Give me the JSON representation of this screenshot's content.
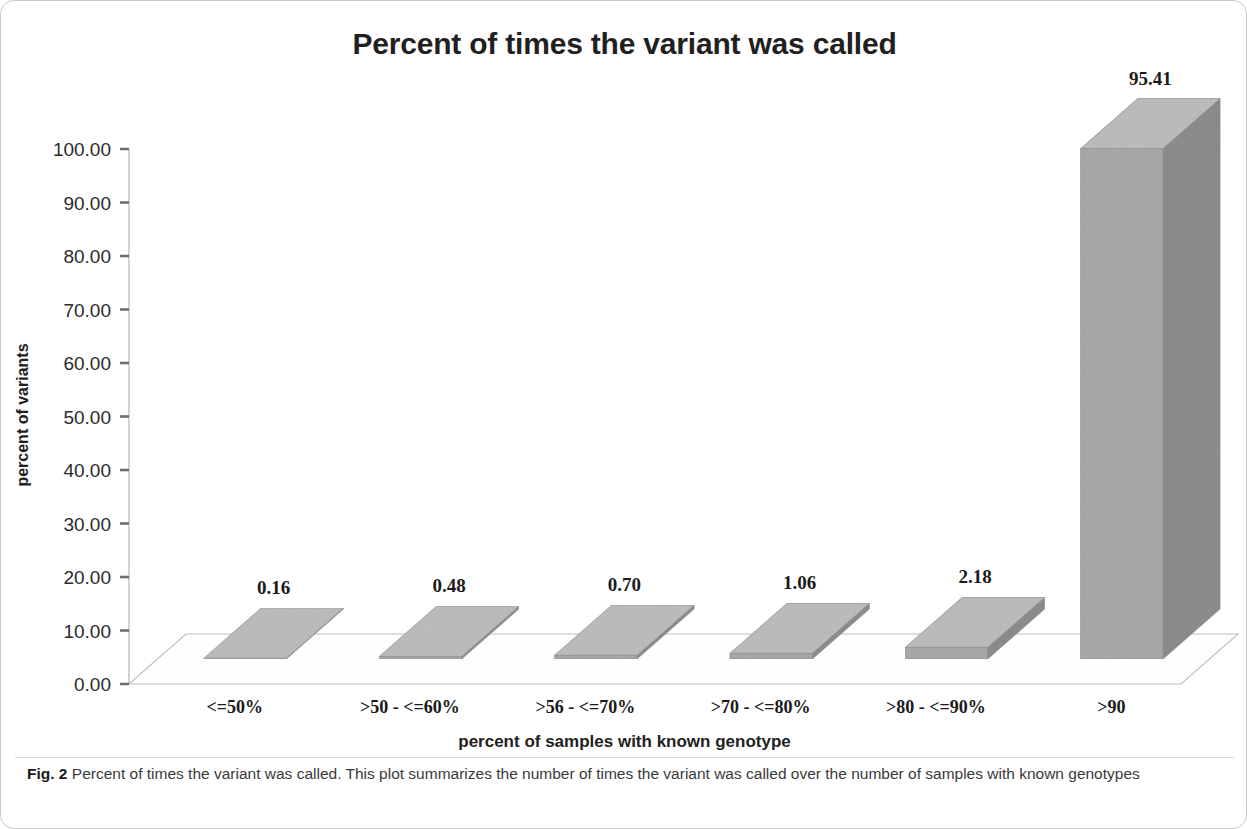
{
  "figure": {
    "caption_label": "Fig. 2",
    "caption_text": "Percent of times the variant was called. This plot summarizes the number of times the variant was called over the number of samples with known genotypes"
  },
  "chart_data": {
    "type": "bar",
    "title": "Percent of times the variant was called",
    "xlabel": "percent of samples with known genotype",
    "ylabel": "percent of variants",
    "categories": [
      "<=50%",
      ">50 - <=60%",
      ">56 - <=70%",
      ">70 - <=80%",
      ">80 - <=90%",
      ">90"
    ],
    "values": [
      0.16,
      0.48,
      0.7,
      1.06,
      2.18,
      95.41
    ],
    "value_labels": [
      "0.16",
      "0.48",
      "0.70",
      "1.06",
      "2.18",
      "95.41"
    ],
    "ylim": [
      0,
      100
    ],
    "ytick_values": [
      0,
      10,
      20,
      30,
      40,
      50,
      60,
      70,
      80,
      90,
      100
    ],
    "ytick_labels": [
      "0.00",
      "10.00",
      "20.00",
      "30.00",
      "40.00",
      "50.00",
      "60.00",
      "70.00",
      "80.00",
      "90.00",
      "100.00"
    ],
    "grid": false,
    "legend": "none",
    "style": "3d-column",
    "colors": {
      "bar_front": "#a9a9a9",
      "bar_top": "#bdbdbd",
      "bar_side": "#8d8d8d",
      "floor": "#fcfcfc",
      "axis": "#b5b5b5",
      "text": "#231f20"
    }
  }
}
